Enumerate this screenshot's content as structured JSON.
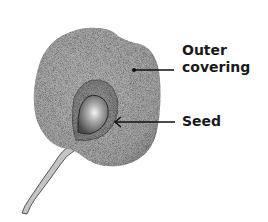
{
  "diagram": {
    "labels": {
      "outer_covering_line1": "Outer",
      "outer_covering_line2": "covering",
      "seed": "Seed"
    },
    "colors": {
      "fruit_fill": "#a9a9a9",
      "fruit_shade": "#8c8c8c",
      "cavity_fill": "#999999",
      "seed_fill": "#5a5a5a",
      "seed_highlight": "#f2f2f2",
      "stem": "#bdbdbd",
      "line": "#111111"
    }
  }
}
